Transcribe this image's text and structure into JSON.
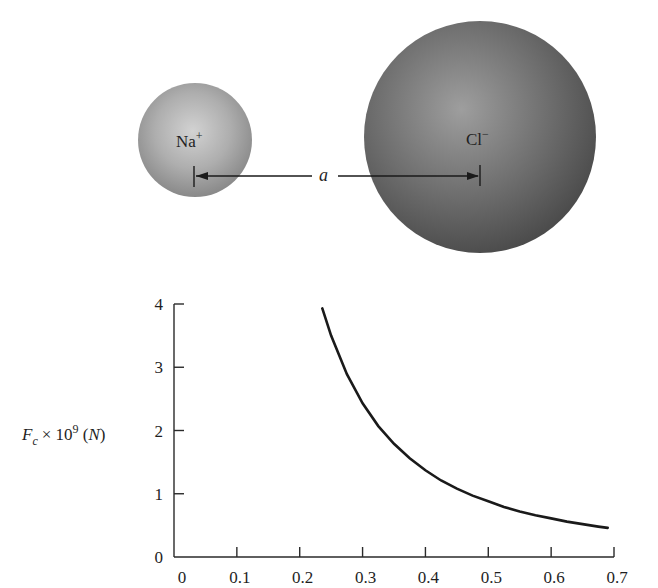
{
  "diagram": {
    "ions": [
      {
        "label": "Na",
        "charge": "+",
        "color_center": "#cfcfcf",
        "color_edge": "#8a8a8a"
      },
      {
        "label": "Cl",
        "charge": "−",
        "color_center": "#9a9a9a",
        "color_edge": "#4e4e4e"
      }
    ],
    "separation_label": "a"
  },
  "chart_data": {
    "type": "line",
    "title": "",
    "xlabel": "",
    "ylabel_main": "F",
    "ylabel_sub": "c",
    "ylabel_times": "× 10",
    "ylabel_exp": "9",
    "ylabel_unit_open": " (",
    "ylabel_unit": "N",
    "ylabel_unit_close": ")",
    "xlim": [
      0,
      0.7
    ],
    "ylim": [
      0,
      4
    ],
    "xticks": [
      "0",
      "0.1",
      "0.2",
      "0.3",
      "0.4",
      "0.5",
      "0.6",
      "0.7"
    ],
    "yticks": [
      "0",
      "1",
      "2",
      "3",
      "4"
    ],
    "grid": false,
    "legend": false,
    "line_color": "#1a1a1a",
    "series": [
      {
        "name": "Coulomb force",
        "x": [
          0.236,
          0.25,
          0.275,
          0.3,
          0.325,
          0.35,
          0.375,
          0.4,
          0.425,
          0.45,
          0.475,
          0.5,
          0.525,
          0.55,
          0.575,
          0.6,
          0.625,
          0.65,
          0.675,
          0.69
        ],
        "values": [
          3.93,
          3.5,
          2.89,
          2.43,
          2.07,
          1.79,
          1.56,
          1.37,
          1.21,
          1.08,
          0.97,
          0.88,
          0.79,
          0.72,
          0.66,
          0.61,
          0.56,
          0.52,
          0.48,
          0.46
        ]
      }
    ]
  }
}
